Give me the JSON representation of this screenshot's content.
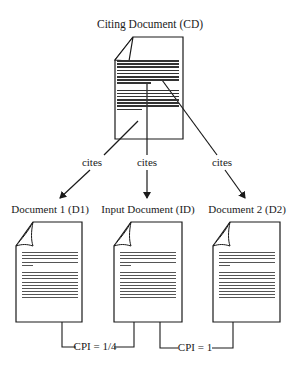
{
  "diagram": {
    "citing_document": {
      "label": "Citing Document (CD)"
    },
    "edges": [
      {
        "label": "cites",
        "from": "CD",
        "to": "D1"
      },
      {
        "label": "cites",
        "from": "CD",
        "to": "ID"
      },
      {
        "label": "cites",
        "from": "CD",
        "to": "D2"
      }
    ],
    "documents": [
      {
        "id": "D1",
        "label": "Document 1 (D1)"
      },
      {
        "id": "ID",
        "label": "Input Document (ID)"
      },
      {
        "id": "D2",
        "label": "Document 2 (D2)"
      }
    ],
    "cpi": [
      {
        "label": "CPI = 1/4",
        "between": [
          "D1",
          "ID"
        ]
      },
      {
        "label": "CPI = 1",
        "between": [
          "ID",
          "D2"
        ]
      }
    ],
    "colors": {
      "stroke": "#1a1a1a",
      "background": "#ffffff"
    }
  }
}
